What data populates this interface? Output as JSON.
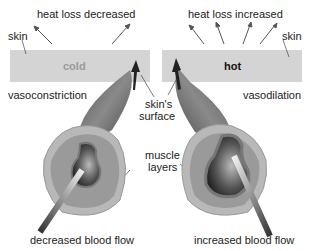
{
  "left_panel": {
    "heat_label": "heat loss decreased",
    "skin_label": "skin",
    "band_label": "cold",
    "state_label": "vasoconstriction",
    "flow_label": "decreased blood flow"
  },
  "right_panel": {
    "heat_label": "heat loss increased",
    "skin_label": "skin",
    "band_label": "hot",
    "state_label": "vasodilation",
    "flow_label": "increased blood flow"
  },
  "center": {
    "surface_label_1": "skin's",
    "surface_label_2": "surface",
    "muscle_label_1": "muscle",
    "muscle_label_2": "layers"
  },
  "colors": {
    "skin_band": "#d4d4d4",
    "vessel_outer": "#8a8a8a",
    "muscle": "#9a9a9a",
    "lumen_dark": "#333333",
    "cold_text": "#9a9a9a",
    "hot_text": "#111111"
  }
}
